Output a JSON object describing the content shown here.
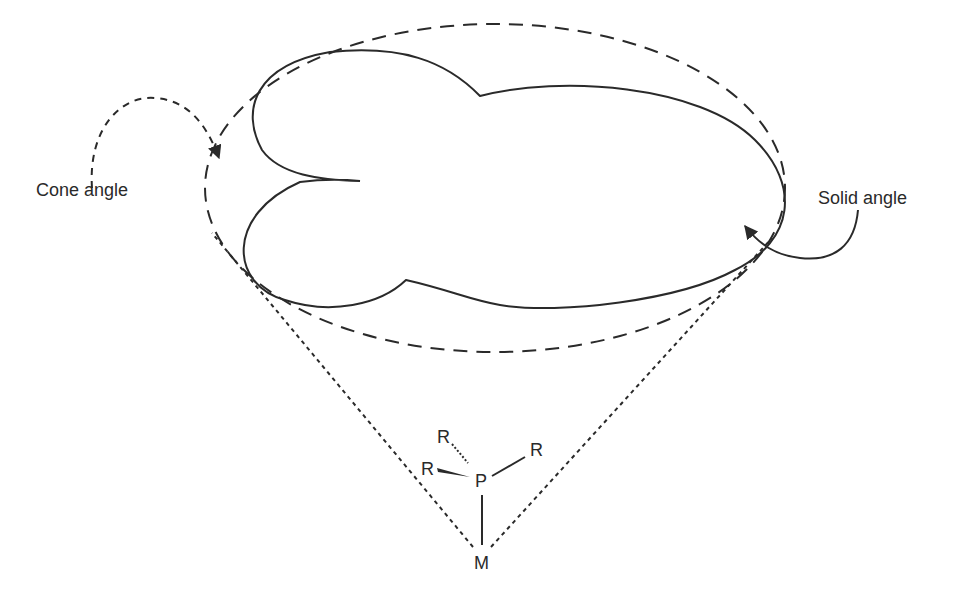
{
  "diagram": {
    "type": "ligand steric parameter illustration",
    "labels": {
      "cone_angle": "Cone angle",
      "solid_angle": "Solid angle"
    },
    "molecule": {
      "central_atom": "P",
      "metal": "M",
      "substituents": [
        "R",
        "R",
        "R"
      ]
    },
    "colors": {
      "stroke": "#2a2a2a",
      "background": "#ffffff"
    }
  }
}
